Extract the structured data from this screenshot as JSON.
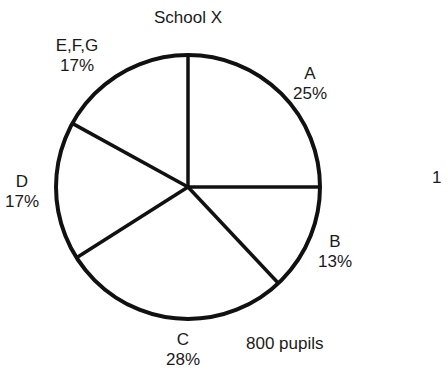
{
  "chart_data": {
    "type": "pie",
    "title": "School X",
    "total_label": "800 pupils",
    "total": 800,
    "categories": [
      "A",
      "B",
      "C",
      "D",
      "E,F,G"
    ],
    "values": [
      25,
      13,
      28,
      17,
      17
    ],
    "value_labels": [
      "25%",
      "13%",
      "28%",
      "17%",
      "17%"
    ],
    "unit": "%",
    "start_angle_deg": 0,
    "direction": "clockwise",
    "colors": {
      "fill": "#ffffff",
      "stroke": "#111111"
    },
    "cropped_edge_text": "1"
  },
  "labels": {
    "title": "School X",
    "a_name": "A",
    "a_pct": "25%",
    "b_name": "B",
    "b_pct": "13%",
    "c_name": "C",
    "c_pct": "28%",
    "d_name": "D",
    "d_pct": "17%",
    "efg_name": "E,F,G",
    "efg_pct": "17%",
    "total": "800 pupils",
    "edge_fragment": "1"
  }
}
